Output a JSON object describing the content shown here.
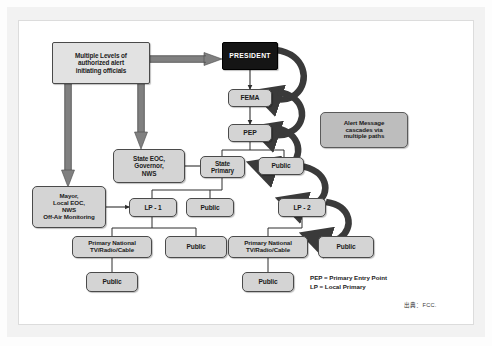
{
  "diagram": {
    "title_present": false,
    "colors": {
      "node_fill": "#d4d4d4",
      "node_fill_light": "#e2e2e2",
      "node_border": "#4a4a4a",
      "president_fill": "#151515",
      "president_text": "#ffffff",
      "callout_fill": "#bdbdbd",
      "connector": "#3c3c3c",
      "thick_arrow": "#3a3a3a",
      "frame": "#f2f2f2",
      "page_background": "#ffffff"
    },
    "nodes": [
      {
        "id": "officials",
        "label": "Multiple Levels of\nauthorized alert\ninitiating officials",
        "style": "square-light"
      },
      {
        "id": "president",
        "label": "PRESIDENT",
        "style": "dark"
      },
      {
        "id": "fema",
        "label": "FEMA",
        "style": "rounded"
      },
      {
        "id": "pep",
        "label": "PEP",
        "style": "rounded"
      },
      {
        "id": "callout",
        "label": "Alert Message\ncascades via\nmultiple paths",
        "style": "callout"
      },
      {
        "id": "state_eoc",
        "label": "State EOC,\nGovernor,\nNWS",
        "style": "rounded"
      },
      {
        "id": "state_primary",
        "label": "State\nPrimary",
        "style": "rounded"
      },
      {
        "id": "public_top",
        "label": "Public",
        "style": "rounded"
      },
      {
        "id": "mayor",
        "label": "Mayor,\nLocal EOC,\nNWS\nOff-Air Monitoring",
        "style": "rounded"
      },
      {
        "id": "lp1",
        "label": "LP - 1",
        "style": "rounded"
      },
      {
        "id": "public_lp1_row",
        "label": "Public",
        "style": "rounded"
      },
      {
        "id": "lp2",
        "label": "LP - 2",
        "style": "rounded"
      },
      {
        "id": "primary_national_left",
        "label": "Primary National\nTV/Radio/Cable",
        "style": "rounded"
      },
      {
        "id": "public_mid",
        "label": "Public",
        "style": "rounded"
      },
      {
        "id": "primary_national_right",
        "label": "Primary National\nTV/Radio/Cable",
        "style": "rounded"
      },
      {
        "id": "public_lp2",
        "label": "Public",
        "style": "rounded"
      },
      {
        "id": "public_bottom_left",
        "label": "Public",
        "style": "rounded"
      },
      {
        "id": "public_bottom_right",
        "label": "Public",
        "style": "rounded"
      }
    ],
    "edges": [
      {
        "from": "officials",
        "to": "president",
        "kind": "thick-straight"
      },
      {
        "from": "officials",
        "to": "mayor",
        "kind": "thick-straight"
      },
      {
        "from": "officials",
        "to": "state_eoc",
        "kind": "thick-straight"
      },
      {
        "from": "president",
        "to": "fema",
        "kind": "thin"
      },
      {
        "from": "fema",
        "to": "pep",
        "kind": "thin"
      },
      {
        "from": "president",
        "to": "fema",
        "kind": "thick-curve"
      },
      {
        "from": "fema",
        "to": "pep",
        "kind": "thick-curve"
      },
      {
        "from": "pep",
        "to": "public_top",
        "kind": "thick-curve"
      },
      {
        "from": "public_top",
        "to": "lp2",
        "kind": "thick-curve"
      },
      {
        "from": "lp2",
        "to": "public_lp2",
        "kind": "thick-curve"
      },
      {
        "from": "pep",
        "to": "state_primary",
        "kind": "thin"
      },
      {
        "from": "pep",
        "to": "public_top",
        "kind": "thin"
      },
      {
        "from": "state_eoc",
        "to": "state_primary",
        "kind": "thin-arrow"
      },
      {
        "from": "mayor",
        "to": "lp1",
        "kind": "thin-arrow"
      },
      {
        "from": "state_primary",
        "to": "lp1",
        "kind": "thin"
      },
      {
        "from": "state_primary",
        "to": "public_lp1_row",
        "kind": "thin"
      },
      {
        "from": "lp1",
        "to": "primary_national_left",
        "kind": "thin"
      },
      {
        "from": "lp1",
        "to": "public_mid",
        "kind": "thin"
      },
      {
        "from": "lp2",
        "to": "primary_national_right",
        "kind": "thin"
      },
      {
        "from": "primary_national_left",
        "to": "public_bottom_left",
        "kind": "thin"
      },
      {
        "from": "primary_national_right",
        "to": "public_bottom_right",
        "kind": "thin"
      }
    ],
    "legend": "PEP = Primary Entry Point\nLP = Local Primary",
    "source_note": "出典：FCC."
  }
}
